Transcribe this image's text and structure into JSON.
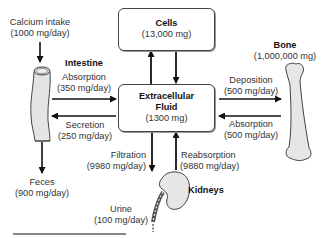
{
  "diagram": {
    "compartments": {
      "cells": {
        "name": "Cells",
        "amount": "(13,000 mg)"
      },
      "ecf": {
        "name_line1": "Extracellular",
        "name_line2": "Fluid",
        "amount": "(1300 mg)"
      },
      "bone": {
        "name": "Bone",
        "amount": "(1,000,000 mg)"
      },
      "intestine": {
        "name": "Intestine"
      },
      "kidneys": {
        "name": "Kidneys"
      }
    },
    "flows": {
      "intake": {
        "label": "Calcium intake",
        "rate": "(1000 mg/day)"
      },
      "intestinal_absorption": {
        "label": "Absorption",
        "rate": "(350 mg/day)"
      },
      "secretion": {
        "label": "Secretion",
        "rate": "(250 mg/day)"
      },
      "feces": {
        "label": "Feces",
        "rate": "(900 mg/day)"
      },
      "deposition": {
        "label": "Deposition",
        "rate": "(500 mg/day)"
      },
      "bone_absorption": {
        "label": "Absorption",
        "rate": "(500 mg/day)"
      },
      "filtration": {
        "label": "Filtration",
        "rate": "(9980 mg/day)"
      },
      "reabsorption": {
        "label": "Reabsorption",
        "rate": "(9880 mg/day)"
      },
      "urine": {
        "label": "Urine",
        "rate": "(100 mg/day)"
      }
    },
    "colors": {
      "arrow": "#111111",
      "organ_fill": "#e6e6e6",
      "organ_stroke": "#444444",
      "box_border": "#444444"
    }
  }
}
